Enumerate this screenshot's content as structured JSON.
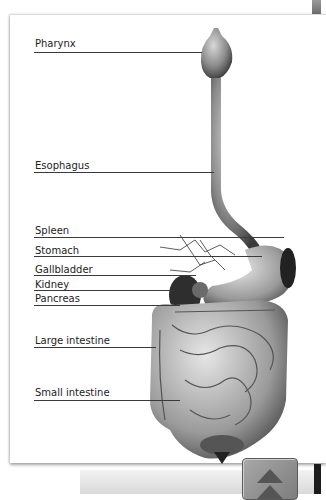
{
  "diagram": {
    "labels": [
      {
        "id": "pharynx",
        "text": "Pharynx"
      },
      {
        "id": "esophagus",
        "text": "Esophagus"
      },
      {
        "id": "spleen",
        "text": "Spleen"
      },
      {
        "id": "stomach",
        "text": "Stomach"
      },
      {
        "id": "gallbladder",
        "text": "Gallbladder"
      },
      {
        "id": "kidney",
        "text": "Kidney"
      },
      {
        "id": "pancreas",
        "text": "Pancreas"
      },
      {
        "id": "large-intestine",
        "text": "Large intestine"
      },
      {
        "id": "small-intestine",
        "text": "Small intestine"
      }
    ]
  },
  "controls": {
    "scroll_up_icon": "double-chevron-up-icon"
  }
}
